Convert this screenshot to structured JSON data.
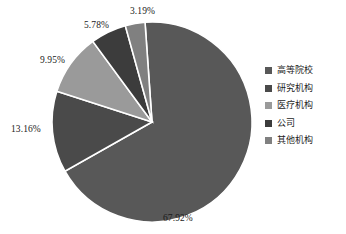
{
  "chart_data": {
    "type": "pie",
    "title": "",
    "xlabel": "",
    "ylabel": "",
    "legend_position": "right",
    "grid": false,
    "categories": [
      "高等院校",
      "研究机构",
      "医疗机构",
      "公司",
      "其他机构"
    ],
    "values": [
      67.92,
      13.16,
      9.95,
      5.78,
      3.19
    ],
    "value_suffix": "%",
    "labels": [
      "67.92%",
      "13.16%",
      "9.95%",
      "5.78%",
      "3.19%"
    ],
    "colors": [
      "#585858",
      "#4a4a4a",
      "#9a9a9a",
      "#3c3c3c",
      "#808080"
    ],
    "slice_border_color": "#ffffff",
    "start_angle_deg": -4,
    "slices": [
      {
        "label": "高等院校",
        "value": 67.92,
        "text": "67.92%",
        "color": "#585858"
      },
      {
        "label": "研究机构",
        "value": 13.16,
        "text": "13.16%",
        "color": "#4a4a4a"
      },
      {
        "label": "医疗机构",
        "value": 9.95,
        "text": "9.95%",
        "color": "#9a9a9a"
      },
      {
        "label": "公司",
        "value": 5.78,
        "text": "5.78%",
        "color": "#3c3c3c"
      },
      {
        "label": "其他机构",
        "value": 3.19,
        "text": "3.19%",
        "color": "#808080"
      }
    ]
  },
  "legend": {
    "items": [
      {
        "label": "高等院校",
        "color": "#585858"
      },
      {
        "label": "研究机构",
        "color": "#4a4a4a"
      },
      {
        "label": "医疗机构",
        "color": "#9a9a9a"
      },
      {
        "label": "公司",
        "color": "#3c3c3c"
      },
      {
        "label": "其他机构",
        "color": "#808080"
      }
    ]
  },
  "callouts": {
    "pct_67": "67.92%",
    "pct_13": "13.16%",
    "pct_9": "9.95%",
    "pct_5": "5.78%",
    "pct_3": "3.19%"
  }
}
